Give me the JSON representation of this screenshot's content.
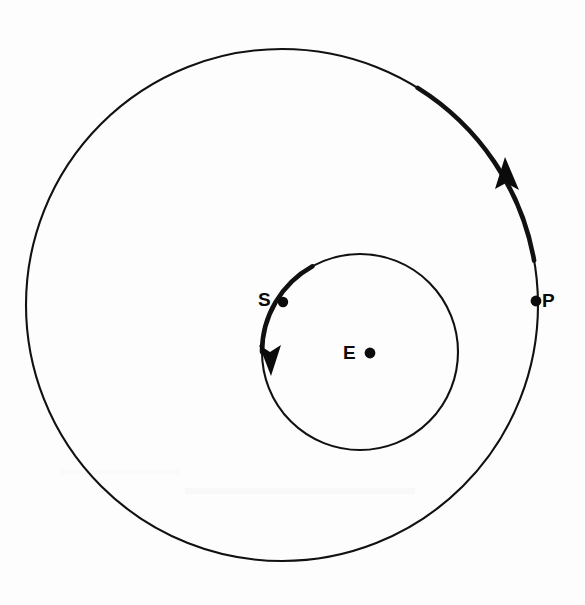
{
  "figure": {
    "kind": "orbital-diagram",
    "background_color": "#fdfdfd",
    "stroke_color": "#111111",
    "width": 585,
    "height": 605
  },
  "orbits": [
    {
      "id": "outer-orbit",
      "name": "outer-orbit-circle",
      "center_x": 282,
      "center_y": 305,
      "radius": 256,
      "stroke_width": 2.1,
      "direction": "counterclockwise",
      "highlight_arc": {
        "from_deg": -10,
        "to_deg": -58,
        "stroke_width": 4.6
      },
      "arrow": {
        "tip_x": 506,
        "tip_y": 160,
        "points": "up-left"
      }
    },
    {
      "id": "inner-orbit",
      "name": "inner-orbit-circle",
      "center_x": 360,
      "center_y": 352,
      "radius": 98,
      "stroke_width": 2.1,
      "direction": "counterclockwise",
      "highlight_arc": {
        "from_deg": 180,
        "to_deg": 241,
        "stroke_width": 4.6
      },
      "arrow": {
        "tip_x": 271,
        "tip_y": 372,
        "points": "down"
      }
    }
  ],
  "points": [
    {
      "id": "S",
      "label": "S",
      "name": "point-s",
      "dot_x": 283,
      "dot_y": 302,
      "dot_radius": 5.2,
      "label_x": 258,
      "label_y": 290,
      "on_orbit": "inner-orbit"
    },
    {
      "id": "E",
      "label": "E",
      "name": "point-e",
      "dot_x": 370,
      "dot_y": 353,
      "dot_radius": 5.4,
      "label_x": 343,
      "label_y": 343,
      "on_orbit": "center"
    },
    {
      "id": "P",
      "label": "P",
      "name": "point-p",
      "dot_x": 536,
      "dot_y": 301,
      "dot_radius": 5.4,
      "label_x": 542,
      "label_y": 291,
      "on_orbit": "outer-orbit"
    }
  ],
  "labels": {
    "s": "S",
    "e": "E",
    "p": "P"
  }
}
